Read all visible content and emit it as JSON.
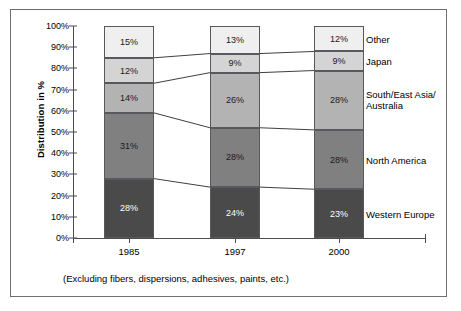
{
  "chart_data": {
    "type": "bar",
    "subtype": "stacked-percentage",
    "title": "",
    "subtitle": "",
    "xlabel": "",
    "ylabel": "Distribution in %",
    "categories": [
      "1985",
      "1997",
      "2000"
    ],
    "ylim": [
      0,
      100
    ],
    "ytick_labels": [
      "0%",
      "10%",
      "20%",
      "30%",
      "40%",
      "50%",
      "60%",
      "70%",
      "80%",
      "90%",
      "100%"
    ],
    "ytick_values": [
      0,
      10,
      20,
      30,
      40,
      50,
      60,
      70,
      80,
      90,
      100
    ],
    "grid": false,
    "legend_position": "right-inline",
    "stack_order_bottom_to_top": [
      "Western Europe",
      "North America",
      "South/East Asia/Australia",
      "Japan",
      "Other"
    ],
    "series": [
      {
        "name": "Western Europe",
        "legend_label": "Western Europe",
        "color": "#4a4a4a",
        "label_color": "#ffffff",
        "values": [
          28,
          24,
          23
        ],
        "value_labels": [
          "28%",
          "24%",
          "23%"
        ]
      },
      {
        "name": "North America",
        "legend_label": "North America",
        "color": "#808080",
        "label_color": "#1a1a1a",
        "values": [
          31,
          28,
          28
        ],
        "value_labels": [
          "31%",
          "28%",
          "28%"
        ]
      },
      {
        "name": "South/East Asia/Australia",
        "legend_label": "South/East Asia/\nAustralia",
        "color": "#b3b3b3",
        "label_color": "#1a1a1a",
        "values": [
          14,
          26,
          28
        ],
        "value_labels": [
          "14%",
          "26%",
          "28%"
        ]
      },
      {
        "name": "Japan",
        "legend_label": "Japan",
        "color": "#d4d4d4",
        "label_color": "#1a1a1a",
        "values": [
          12,
          9,
          9
        ],
        "value_labels": [
          "12%",
          "9%",
          "9%"
        ]
      },
      {
        "name": "Other",
        "legend_label": "Other",
        "color": "#efefef",
        "label_color": "#1a1a1a",
        "values": [
          15,
          13,
          12
        ],
        "value_labels": [
          "15%",
          "13%",
          "12%"
        ]
      }
    ]
  },
  "footnote": "(Excluding fibers, dispersions, adhesives, paints, etc.)",
  "colors": {
    "frame_border": "#6e6e73",
    "axis": "#4d4d4d",
    "segment_border": "#59595d",
    "connector": "#3f3f3f",
    "background": "#ffffff"
  }
}
